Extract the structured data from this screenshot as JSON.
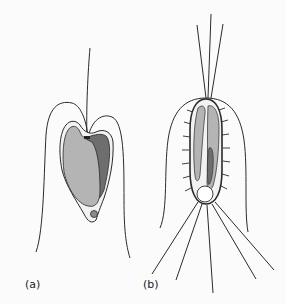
{
  "figure": {
    "panels": [
      {
        "id": "a",
        "label": "(a)",
        "description": "Cell with single apical flagellum, large gray inner body with darker lobe, small granule at base, enclosed in a bell-shaped outer membrane"
      },
      {
        "id": "b",
        "label": "(b)",
        "description": "Elongated spiny cell with apical tuft of three flagella, two elongate inner bodies, round vesicle at base, radiating basal spines, enclosed in a bell-shaped outer membrane"
      }
    ],
    "colors": {
      "background": "#fbfbfb",
      "line": "#2a2a2a",
      "light_fill": "#b4b4b4",
      "dark_fill": "#6e6e6e",
      "cell_fill": "#f2f2f2"
    }
  }
}
